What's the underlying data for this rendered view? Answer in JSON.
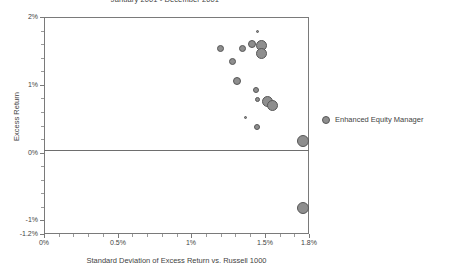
{
  "chart_data": {
    "type": "scatter",
    "title": "January 2001 - December 2001",
    "xlabel": "Standard Deviation of Excess Return vs. Russell 1000",
    "ylabel": "Excess Return",
    "xlim": [
      0,
      1.8
    ],
    "ylim": [
      -1.2,
      2
    ],
    "xticks": [
      "0%",
      "0.5%",
      "1%",
      "1.5%",
      "1.8%"
    ],
    "xtick_values": [
      0,
      0.5,
      1.0,
      1.5,
      1.8
    ],
    "yticks": [
      "2%",
      "1%",
      "0%",
      "-1%",
      "-1.2%"
    ],
    "ytick_values": [
      2,
      1,
      0,
      -1,
      -1.2
    ],
    "grid": false,
    "zero_line": true,
    "legend_position": "right",
    "series": [
      {
        "name": "Enhanced Equity Manager",
        "color": "#8e8e8e",
        "points": [
          {
            "x": 1.2,
            "y": 1.54,
            "size": 7
          },
          {
            "x": 1.28,
            "y": 1.34,
            "size": 7
          },
          {
            "x": 1.35,
            "y": 1.54,
            "size": 7
          },
          {
            "x": 1.41,
            "y": 1.6,
            "size": 8
          },
          {
            "x": 1.45,
            "y": 1.79,
            "size": 3
          },
          {
            "x": 1.48,
            "y": 1.58,
            "size": 11
          },
          {
            "x": 1.48,
            "y": 1.46,
            "size": 11
          },
          {
            "x": 1.31,
            "y": 1.05,
            "size": 8
          },
          {
            "x": 1.44,
            "y": 0.93,
            "size": 6
          },
          {
            "x": 1.45,
            "y": 0.79,
            "size": 5
          },
          {
            "x": 1.52,
            "y": 0.76,
            "size": 11
          },
          {
            "x": 1.55,
            "y": 0.7,
            "size": 11
          },
          {
            "x": 1.37,
            "y": 0.52,
            "size": 3
          },
          {
            "x": 1.45,
            "y": 0.38,
            "size": 6
          },
          {
            "x": 1.76,
            "y": 0.17,
            "size": 12
          },
          {
            "x": 1.76,
            "y": -0.82,
            "size": 12
          }
        ]
      }
    ]
  },
  "legend": {
    "label": "Enhanced Equity Manager",
    "marker_color": "#8e8e8e"
  }
}
